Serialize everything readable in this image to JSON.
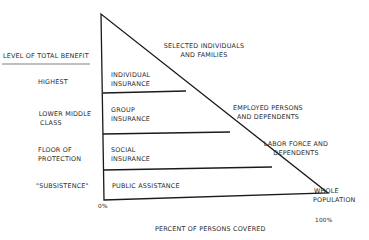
{
  "diagram": {
    "type": "coverage-pyramid",
    "axis_title_left": "LEVEL OF TOTAL BENEFIT",
    "x_axis": {
      "label": "PERCENT OF PERSONS COVERED",
      "start_label": "0%",
      "end_label": "100%"
    },
    "levels": [
      {
        "benefit_level": "HIGHEST",
        "program": [
          "INDIVIDUAL",
          "INSURANCE"
        ],
        "coverage": [
          "SELECTED INDIVIDUALS",
          "AND FAMILIES"
        ]
      },
      {
        "benefit_level": [
          "LOWER MIDDLE",
          "CLASS"
        ],
        "program": [
          "GROUP",
          "INSURANCE"
        ],
        "coverage": [
          "EMPLOYED PERSONS",
          "AND DEPENDENTS"
        ]
      },
      {
        "benefit_level": [
          "FLOOR OF",
          "PROTECTION"
        ],
        "program": [
          "SOCIAL",
          "INSURANCE"
        ],
        "coverage": [
          "LABOR FORCE AND",
          "DEPENDENTS"
        ]
      },
      {
        "benefit_level": "\"SUBSISTENCE\"",
        "program": "PUBLIC ASSISTANCE",
        "coverage": [
          "WHOLE",
          "POPULATION"
        ]
      }
    ],
    "line_color": "#1a1a1a"
  }
}
